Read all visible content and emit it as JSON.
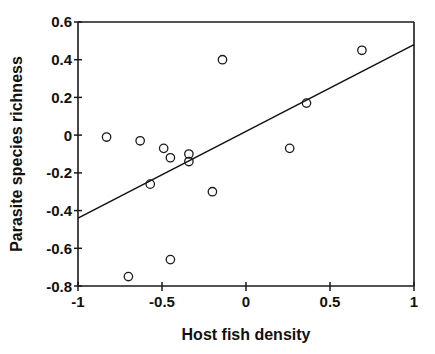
{
  "chart_data": {
    "type": "scatter",
    "title": "",
    "xlabel": "Host fish density",
    "ylabel": "Parasite species richness",
    "xlim": [
      -1,
      1
    ],
    "ylim": [
      -0.8,
      0.6
    ],
    "xticks": [
      -1,
      -0.5,
      0,
      0.5,
      1
    ],
    "xtick_labels": [
      "-1",
      "-0.5",
      "0",
      "0.5",
      "1"
    ],
    "yticks": [
      -0.8,
      -0.6,
      -0.4,
      -0.2,
      0,
      0.2,
      0.4,
      0.6
    ],
    "ytick_labels": [
      "-0.8",
      "-0.6",
      "-0.4",
      "-0.2",
      "0",
      "0.2",
      "0.4",
      "0.6"
    ],
    "grid": false,
    "legend": null,
    "marker": "open-circle",
    "marker_color": "#1a1a1a",
    "points": [
      {
        "x": -0.83,
        "y": -0.01
      },
      {
        "x": -0.7,
        "y": -0.75
      },
      {
        "x": -0.63,
        "y": -0.03
      },
      {
        "x": -0.57,
        "y": -0.26
      },
      {
        "x": -0.49,
        "y": -0.07
      },
      {
        "x": -0.45,
        "y": -0.12
      },
      {
        "x": -0.45,
        "y": -0.66
      },
      {
        "x": -0.34,
        "y": -0.1
      },
      {
        "x": -0.34,
        "y": -0.14
      },
      {
        "x": -0.2,
        "y": -0.3
      },
      {
        "x": -0.14,
        "y": 0.4
      },
      {
        "x": 0.26,
        "y": -0.07
      },
      {
        "x": 0.36,
        "y": 0.17
      },
      {
        "x": 0.69,
        "y": 0.45
      }
    ],
    "trendline": {
      "type": "linear-fit",
      "x_start": -1,
      "y_start": -0.44,
      "x_end": 1,
      "y_end": 0.48,
      "color": "#111111"
    }
  }
}
